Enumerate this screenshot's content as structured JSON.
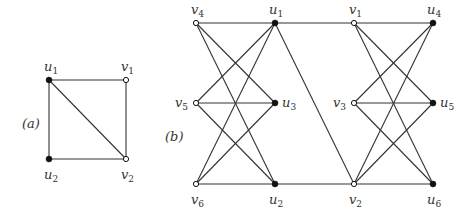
{
  "figure": {
    "panels": [
      {
        "id": "a",
        "caption": "(a)",
        "caption_pos": [
          22,
          124
        ],
        "nodes": [
          {
            "id": "u1",
            "base": "u",
            "sub": "1",
            "x": 49,
            "y": 80,
            "filled": true,
            "label_dx": -5,
            "label_dy": -9
          },
          {
            "id": "v1",
            "base": "v",
            "sub": "1",
            "x": 126,
            "y": 80,
            "filled": false,
            "label_dx": -5,
            "label_dy": -9
          },
          {
            "id": "u2",
            "base": "u",
            "sub": "2",
            "x": 49,
            "y": 159,
            "filled": true,
            "label_dx": -5,
            "label_dy": 20
          },
          {
            "id": "v2",
            "base": "v",
            "sub": "2",
            "x": 126,
            "y": 159,
            "filled": false,
            "label_dx": -5,
            "label_dy": 20
          }
        ],
        "edges": [
          [
            "u1",
            "v1"
          ],
          [
            "u1",
            "u2"
          ],
          [
            "u1",
            "v2"
          ],
          [
            "v1",
            "v2"
          ],
          [
            "u2",
            "v2"
          ]
        ]
      },
      {
        "id": "b",
        "caption": "(b)",
        "caption_pos": [
          165,
          137
        ],
        "nodes": [
          {
            "id": "v4",
            "base": "v",
            "sub": "4",
            "x": 196,
            "y": 23,
            "filled": false,
            "label_dx": -5,
            "label_dy": -9
          },
          {
            "id": "u1",
            "base": "u",
            "sub": "1",
            "x": 275,
            "y": 23,
            "filled": true,
            "label_dx": -6,
            "label_dy": -9
          },
          {
            "id": "v1",
            "base": "v",
            "sub": "1",
            "x": 354,
            "y": 23,
            "filled": false,
            "label_dx": -5,
            "label_dy": -9
          },
          {
            "id": "u4",
            "base": "u",
            "sub": "4",
            "x": 433,
            "y": 23,
            "filled": true,
            "label_dx": -6,
            "label_dy": -9
          },
          {
            "id": "v5",
            "base": "v",
            "sub": "5",
            "x": 196,
            "y": 103,
            "filled": false,
            "label_dx": -21,
            "label_dy": 4
          },
          {
            "id": "u3",
            "base": "u",
            "sub": "3",
            "x": 275,
            "y": 103,
            "filled": true,
            "label_dx": 7,
            "label_dy": 4
          },
          {
            "id": "v3",
            "base": "v",
            "sub": "3",
            "x": 354,
            "y": 103,
            "filled": false,
            "label_dx": -21,
            "label_dy": 4
          },
          {
            "id": "u5",
            "base": "u",
            "sub": "5",
            "x": 433,
            "y": 103,
            "filled": true,
            "label_dx": 7,
            "label_dy": 4
          },
          {
            "id": "v6",
            "base": "v",
            "sub": "6",
            "x": 196,
            "y": 184,
            "filled": false,
            "label_dx": -5,
            "label_dy": 20
          },
          {
            "id": "u2",
            "base": "u",
            "sub": "2",
            "x": 275,
            "y": 184,
            "filled": true,
            "label_dx": -6,
            "label_dy": 20
          },
          {
            "id": "v2",
            "base": "v",
            "sub": "2",
            "x": 354,
            "y": 184,
            "filled": false,
            "label_dx": -5,
            "label_dy": 20
          },
          {
            "id": "u6",
            "base": "u",
            "sub": "6",
            "x": 433,
            "y": 184,
            "filled": true,
            "label_dx": -6,
            "label_dy": 20
          }
        ],
        "edges": [
          [
            "v4",
            "u1"
          ],
          [
            "v4",
            "u3"
          ],
          [
            "v4",
            "u2"
          ],
          [
            "v5",
            "u1"
          ],
          [
            "v5",
            "u3"
          ],
          [
            "v5",
            "u2"
          ],
          [
            "v6",
            "u1"
          ],
          [
            "v6",
            "u3"
          ],
          [
            "v6",
            "u2"
          ],
          [
            "u1",
            "v1"
          ],
          [
            "u1",
            "v2"
          ],
          [
            "u2",
            "v2"
          ],
          [
            "v1",
            "u4"
          ],
          [
            "v1",
            "u5"
          ],
          [
            "v1",
            "u6"
          ],
          [
            "v3",
            "u4"
          ],
          [
            "v3",
            "u5"
          ],
          [
            "v3",
            "u6"
          ],
          [
            "v2",
            "u4"
          ],
          [
            "v2",
            "u5"
          ],
          [
            "v2",
            "u6"
          ]
        ]
      }
    ]
  }
}
